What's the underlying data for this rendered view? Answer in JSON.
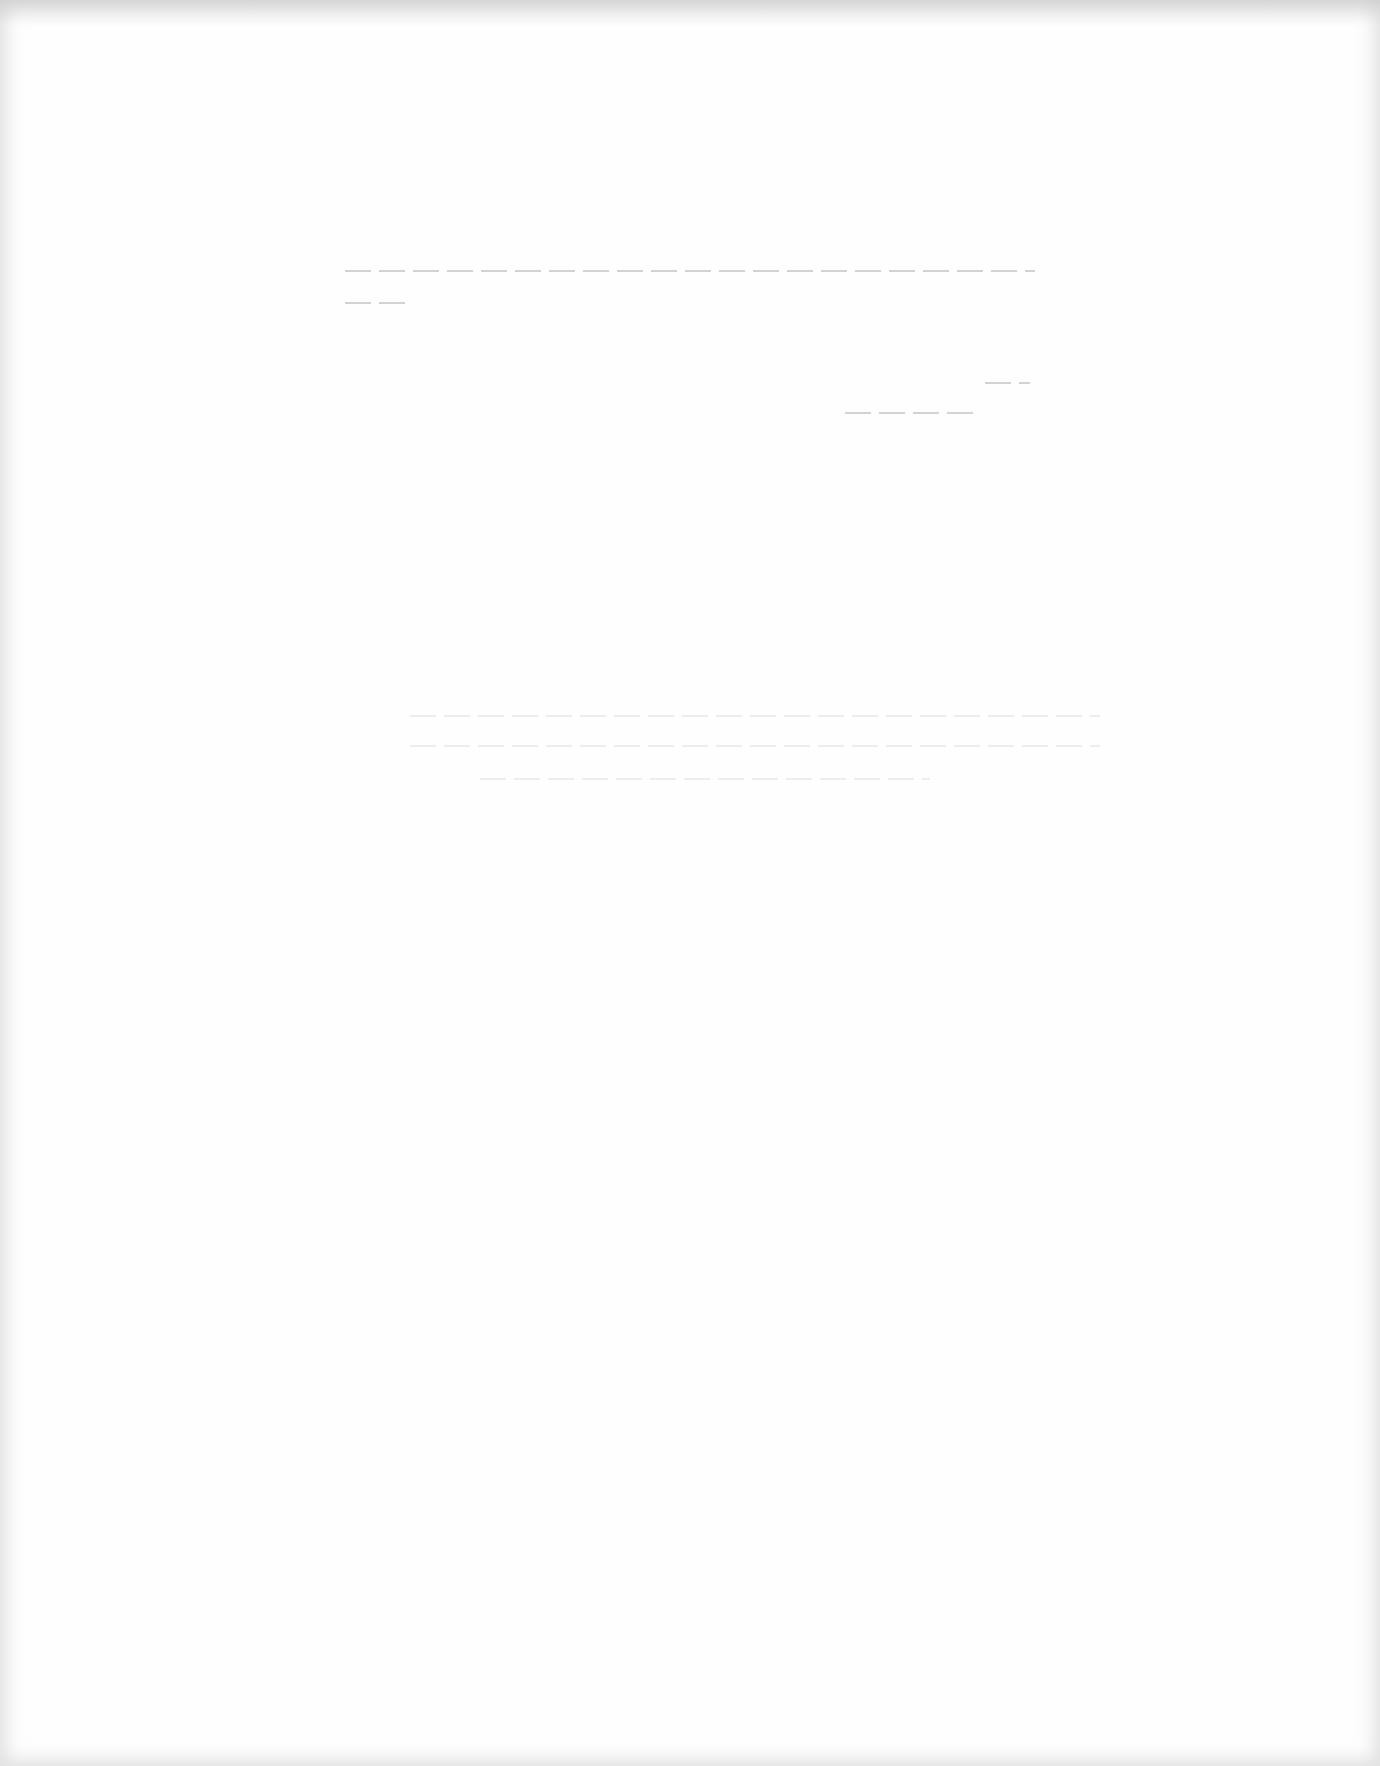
{
  "document": {
    "type": "scanned page",
    "content_legible": false,
    "faded_lines": [
      {
        "id": "line-1",
        "text": ""
      },
      {
        "id": "line-2",
        "text": ""
      },
      {
        "id": "line-3",
        "text": ""
      },
      {
        "id": "line-4",
        "text": ""
      },
      {
        "id": "line-5",
        "text": ""
      }
    ]
  }
}
